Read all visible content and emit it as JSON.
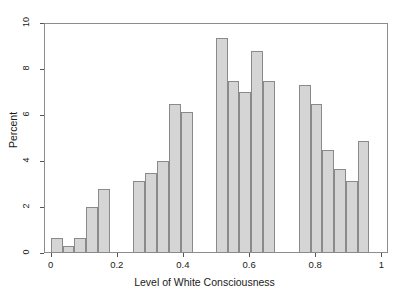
{
  "chart_data": {
    "type": "bar",
    "title": "",
    "subtitle": "",
    "xlabel": "Level of White Consciousness",
    "ylabel": "Percent",
    "xlim": [
      -0.02,
      1.02
    ],
    "ylim": [
      0,
      10
    ],
    "xticks": [
      0,
      0.2,
      0.4,
      0.6,
      0.8,
      1
    ],
    "xtick_labels": [
      "0",
      "0.2",
      "0.4",
      "0.6",
      "0.8",
      "1"
    ],
    "yticks": [
      0,
      2,
      4,
      6,
      8,
      10
    ],
    "ytick_labels": [
      "0",
      "2",
      "4",
      "6",
      "8",
      "10"
    ],
    "grid": false,
    "legend": null,
    "bar_fill_color": "#d5d5d5",
    "bar_edge_color": "#8a8a8a",
    "bin_width": 0.0357,
    "bins": [
      {
        "x0": 0.0,
        "x1": 0.036,
        "value": 0.65
      },
      {
        "x0": 0.036,
        "x1": 0.071,
        "value": 0.3
      },
      {
        "x0": 0.071,
        "x1": 0.107,
        "value": 0.65
      },
      {
        "x0": 0.107,
        "x1": 0.143,
        "value": 2.0
      },
      {
        "x0": 0.143,
        "x1": 0.179,
        "value": 2.8
      },
      {
        "x0": 0.25,
        "x1": 0.286,
        "value": 3.15
      },
      {
        "x0": 0.286,
        "x1": 0.321,
        "value": 3.5
      },
      {
        "x0": 0.321,
        "x1": 0.357,
        "value": 4.0
      },
      {
        "x0": 0.357,
        "x1": 0.393,
        "value": 6.5
      },
      {
        "x0": 0.393,
        "x1": 0.429,
        "value": 6.15
      },
      {
        "x0": 0.5,
        "x1": 0.536,
        "value": 9.35
      },
      {
        "x0": 0.536,
        "x1": 0.571,
        "value": 7.5
      },
      {
        "x0": 0.571,
        "x1": 0.607,
        "value": 7.0
      },
      {
        "x0": 0.607,
        "x1": 0.643,
        "value": 8.8
      },
      {
        "x0": 0.643,
        "x1": 0.679,
        "value": 7.5
      },
      {
        "x0": 0.75,
        "x1": 0.786,
        "value": 7.3
      },
      {
        "x0": 0.786,
        "x1": 0.821,
        "value": 6.5
      },
      {
        "x0": 0.821,
        "x1": 0.857,
        "value": 4.5
      },
      {
        "x0": 0.857,
        "x1": 0.893,
        "value": 3.65
      },
      {
        "x0": 0.893,
        "x1": 0.929,
        "value": 3.15
      },
      {
        "x0": 0.929,
        "x1": 0.964,
        "value": 4.85
      }
    ]
  }
}
